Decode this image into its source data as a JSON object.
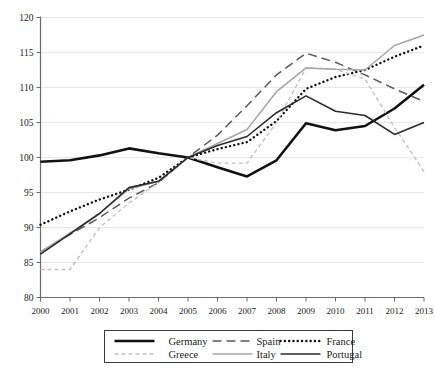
{
  "chart_data": {
    "type": "line",
    "title": "",
    "subtitle": "",
    "xlabel": "",
    "ylabel": "",
    "x": [
      2000,
      2001,
      2002,
      2003,
      2004,
      2005,
      2006,
      2007,
      2008,
      2009,
      2010,
      2011,
      2012,
      2013
    ],
    "xlim": [
      2000,
      2013
    ],
    "ylim": [
      80,
      120
    ],
    "yticks": [
      80,
      85,
      90,
      95,
      100,
      105,
      110,
      115,
      120
    ],
    "xticks": [
      "2000",
      "2001",
      "2002",
      "2003",
      "2004",
      "2005",
      "2006",
      "2007",
      "2008",
      "2009",
      "2010",
      "2011",
      "2012",
      "2013"
    ],
    "grid": true,
    "legend_position": "bottom",
    "series": [
      {
        "name": "Germany",
        "style": "solid",
        "color": "#111111",
        "width": 2.6,
        "values": [
          99.4,
          99.6,
          100.3,
          101.3,
          100.6,
          100.0,
          98.6,
          97.3,
          99.6,
          104.9,
          103.9,
          104.5,
          107.0,
          110.4
        ]
      },
      {
        "name": "Spain",
        "style": "dashed",
        "color": "#5a5a5a",
        "width": 1.5,
        "values": [
          86.5,
          89.0,
          91.4,
          94.2,
          96.4,
          100.0,
          103.2,
          107.4,
          111.8,
          114.9,
          113.6,
          111.8,
          109.8,
          108.0
        ]
      },
      {
        "name": "France",
        "style": "dotted",
        "color": "#111111",
        "width": 2.4,
        "values": [
          90.4,
          92.3,
          94.0,
          95.4,
          97.1,
          100.0,
          101.2,
          102.2,
          105.2,
          109.8,
          111.5,
          112.5,
          114.4,
          116.0
        ]
      },
      {
        "name": "Greece",
        "style": "dashed-light",
        "color": "#c2c2c2",
        "width": 1.4,
        "values": [
          84.0,
          84.0,
          90.0,
          93.5,
          96.4,
          100.0,
          99.2,
          99.2,
          105.0,
          112.8,
          112.6,
          111.2,
          104.3,
          98.0
        ]
      },
      {
        "name": "Italy",
        "style": "solid-light",
        "color": "#a6a6a6",
        "width": 1.5,
        "values": [
          86.5,
          89.2,
          92.0,
          95.5,
          96.6,
          100.0,
          102.0,
          104.0,
          109.4,
          112.8,
          112.6,
          112.5,
          116.0,
          117.5
        ]
      },
      {
        "name": "Portugal",
        "style": "solid-medium",
        "color": "#2a2a2a",
        "width": 1.6,
        "values": [
          86.2,
          89.1,
          92.0,
          95.7,
          96.6,
          100.0,
          101.7,
          103.0,
          106.4,
          108.8,
          106.6,
          106.0,
          103.3,
          105.0
        ]
      }
    ]
  },
  "legend": {
    "row1": [
      "Germany",
      "Spain",
      "France"
    ],
    "row2": [
      "Greece",
      "Italy",
      "Portugal"
    ]
  },
  "caption": ""
}
